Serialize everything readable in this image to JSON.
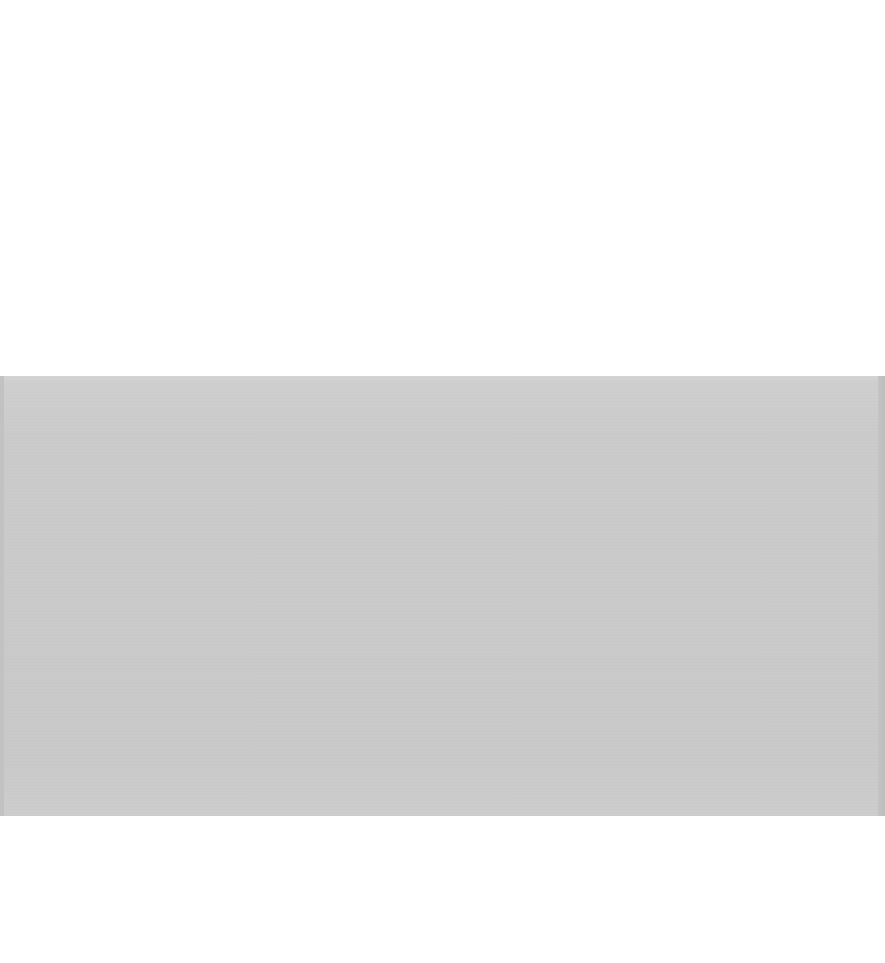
{
  "page": {
    "background_color": "#ffffff"
  },
  "band": {
    "color": "#cbcbcb",
    "edge_color": "#bfbfbf",
    "text": ""
  }
}
